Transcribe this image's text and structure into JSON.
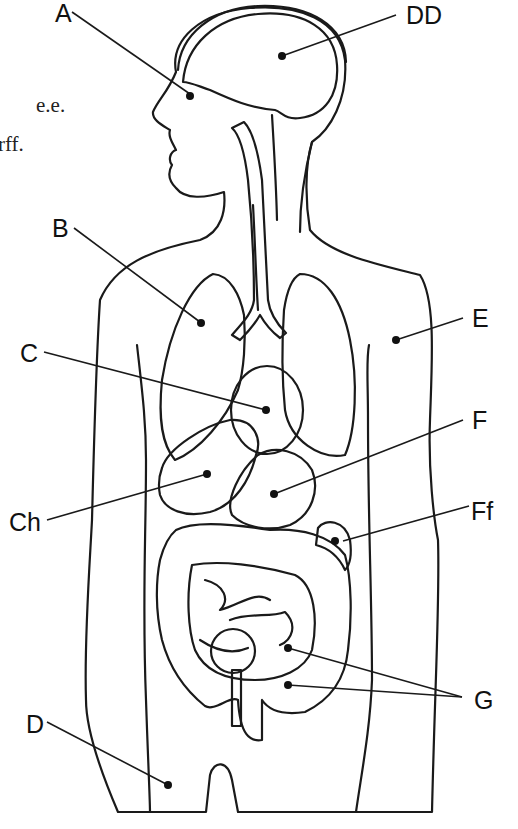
{
  "figure": {
    "type": "anatomical-diagram",
    "side_text": [
      "e.e.",
      "rff."
    ],
    "colors": {
      "skin": "#ececec",
      "brain": "#efefef",
      "lung": "#b9b9b9",
      "heart": "#5e5e5e",
      "liver": "#4f4f4f",
      "stomach": "#e6e6e6",
      "kidney": "#525252",
      "large_intestine": "#f4f4f4",
      "small_intestine": "#d2d2d2",
      "bladder": "#9e9e9e",
      "outline": "#1a1a1a"
    },
    "labels": [
      {
        "id": "A",
        "text": "A",
        "points_to": "eye"
      },
      {
        "id": "DD",
        "text": "DD",
        "points_to": "brain"
      },
      {
        "id": "B",
        "text": "B",
        "points_to": "lung"
      },
      {
        "id": "E",
        "text": "E",
        "points_to": "skin/body wall"
      },
      {
        "id": "C",
        "text": "C",
        "points_to": "heart"
      },
      {
        "id": "F",
        "text": "F",
        "points_to": "stomach"
      },
      {
        "id": "Ch",
        "text": "Ch",
        "points_to": "liver"
      },
      {
        "id": "Ff",
        "text": "Ff",
        "points_to": "kidney"
      },
      {
        "id": "G",
        "text": "G",
        "points_to": "small and large intestine"
      },
      {
        "id": "D",
        "text": "D",
        "points_to": "thigh / body"
      }
    ]
  }
}
